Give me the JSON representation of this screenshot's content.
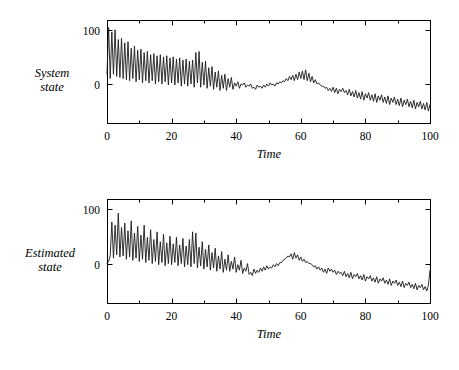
{
  "figure": {
    "background": "#ffffff",
    "line_color": "#1a1a1a",
    "axis_color": "#000000"
  },
  "chart_data": [
    {
      "type": "line",
      "title": "",
      "subtitle": "",
      "xlabel": "Time",
      "ylabel": "System state",
      "ylabel_lines": [
        "System",
        "state"
      ],
      "xlim": [
        0,
        100
      ],
      "ylim": [
        -72,
        118
      ],
      "xticks": [
        0,
        20,
        40,
        60,
        80,
        100
      ],
      "xtick_labels": [
        "0",
        "20",
        "40",
        "60",
        "80",
        "100"
      ],
      "xminor_step": 10,
      "yticks": [
        0,
        100
      ],
      "ytick_labels": [
        "0",
        "100"
      ],
      "grid": false,
      "legend": null,
      "series": [
        {
          "name": "System state",
          "x": [
            0,
            0.5,
            1,
            1.5,
            2,
            2.5,
            3,
            3.5,
            4,
            4.5,
            5,
            5.5,
            6,
            6.5,
            7,
            7.5,
            8,
            8.5,
            9,
            9.5,
            10,
            10.5,
            11,
            11.5,
            12,
            12.5,
            13,
            13.5,
            14,
            14.5,
            15,
            15.5,
            16,
            16.5,
            17,
            17.5,
            18,
            18.5,
            19,
            19.5,
            20,
            20.5,
            21,
            21.5,
            22,
            22.5,
            23,
            23.5,
            24,
            24.5,
            25,
            25.5,
            26,
            26.5,
            27,
            27.5,
            28,
            28.5,
            29,
            29.5,
            30,
            30.5,
            31,
            31.5,
            32,
            32.5,
            33,
            33.5,
            34,
            34.5,
            35,
            35.5,
            36,
            36.5,
            37,
            37.5,
            38,
            38.5,
            39,
            39.5,
            40,
            40.5,
            41,
            41.5,
            42,
            42.5,
            43,
            43.5,
            44,
            44.5,
            45,
            45.5,
            46,
            46.5,
            47,
            47.5,
            48,
            48.5,
            49,
            49.5,
            50,
            50.5,
            51,
            51.5,
            52,
            52.5,
            53,
            53.5,
            54,
            54.5,
            55,
            55.5,
            56,
            56.5,
            57,
            57.5,
            58,
            58.5,
            59,
            59.5,
            60,
            60.5,
            61,
            61.5,
            62,
            62.5,
            63,
            63.5,
            64,
            64.5,
            65,
            65.5,
            66,
            66.5,
            67,
            67.5,
            68,
            68.5,
            69,
            69.5,
            70,
            70.5,
            71,
            71.5,
            72,
            72.5,
            73,
            73.5,
            74,
            74.5,
            75,
            75.5,
            76,
            76.5,
            77,
            77.5,
            78,
            78.5,
            79,
            79.5,
            80,
            80.5,
            81,
            81.5,
            82,
            82.5,
            83,
            83.5,
            84,
            84.5,
            85,
            85.5,
            86,
            86.5,
            87,
            87.5,
            88,
            88.5,
            89,
            89.5,
            90,
            90.5,
            91,
            91.5,
            92,
            92.5,
            93,
            93.5,
            94,
            94.5,
            95,
            95.5,
            96,
            96.5,
            97,
            97.5,
            98,
            98.5,
            99,
            99.5,
            100
          ],
          "y": [
            18,
            104,
            10,
            96,
            18,
            100,
            14,
            82,
            12,
            84,
            10,
            76,
            8,
            78,
            6,
            66,
            10,
            70,
            4,
            62,
            8,
            64,
            2,
            58,
            6,
            60,
            2,
            54,
            6,
            56,
            0,
            52,
            4,
            54,
            0,
            50,
            4,
            52,
            -2,
            48,
            2,
            50,
            -2,
            46,
            2,
            48,
            -4,
            44,
            0,
            46,
            -4,
            42,
            0,
            44,
            -6,
            58,
            2,
            60,
            -6,
            40,
            -2,
            42,
            -8,
            30,
            -4,
            32,
            -10,
            22,
            -6,
            24,
            -12,
            16,
            -8,
            18,
            -12,
            10,
            -6,
            12,
            -10,
            2,
            -4,
            4,
            -8,
            0,
            -2,
            2,
            -6,
            -2,
            -4,
            0,
            -8,
            -6,
            -10,
            -2,
            -6,
            -4,
            -8,
            -2,
            -6,
            0,
            -4,
            2,
            -2,
            0,
            -4,
            2,
            0,
            4,
            2,
            6,
            4,
            10,
            6,
            14,
            8,
            16,
            6,
            18,
            8,
            22,
            10,
            24,
            8,
            26,
            6,
            20,
            4,
            14,
            2,
            8,
            0,
            2,
            -2,
            -4,
            -4,
            -8,
            -6,
            -12,
            -8,
            -14,
            -6,
            -16,
            -8,
            -18,
            -10,
            -14,
            -8,
            -16,
            -12,
            -20,
            -10,
            -22,
            -14,
            -24,
            -12,
            -26,
            -16,
            -28,
            -14,
            -30,
            -18,
            -26,
            -16,
            -30,
            -20,
            -32,
            -18,
            -34,
            -22,
            -30,
            -20,
            -34,
            -24,
            -36,
            -22,
            -38,
            -26,
            -34,
            -24,
            -38,
            -28,
            -40,
            -26,
            -42,
            -30,
            -38,
            -28,
            -42,
            -32,
            -44,
            -30,
            -46,
            -34,
            -42,
            -32,
            -46,
            -36,
            -48,
            -34,
            -50,
            -38,
            -46,
            -36,
            -50,
            -40,
            -52,
            -38,
            -54,
            -42,
            -50,
            -40,
            -54,
            -44,
            -10,
            -48,
            -56
          ]
        }
      ]
    },
    {
      "type": "line",
      "title": "",
      "subtitle": "",
      "xlabel": "Time",
      "ylabel": "Estimated state",
      "ylabel_lines": [
        "Estimated",
        "state"
      ],
      "xlim": [
        0,
        100
      ],
      "ylim": [
        -72,
        118
      ],
      "xticks": [
        0,
        20,
        40,
        60,
        80,
        100
      ],
      "xtick_labels": [
        "0",
        "20",
        "40",
        "60",
        "80",
        "100"
      ],
      "xminor_step": 10,
      "yticks": [
        0,
        100
      ],
      "ytick_labels": [
        "0",
        "100"
      ],
      "grid": false,
      "legend": null,
      "series": [
        {
          "name": "Estimated state",
          "x": [
            0,
            0.5,
            1,
            1.5,
            2,
            2.5,
            3,
            3.5,
            4,
            4.5,
            5,
            5.5,
            6,
            6.5,
            7,
            7.5,
            8,
            8.5,
            9,
            9.5,
            10,
            10.5,
            11,
            11.5,
            12,
            12.5,
            13,
            13.5,
            14,
            14.5,
            15,
            15.5,
            16,
            16.5,
            17,
            17.5,
            18,
            18.5,
            19,
            19.5,
            20,
            20.5,
            21,
            21.5,
            22,
            22.5,
            23,
            23.5,
            24,
            24.5,
            25,
            25.5,
            26,
            26.5,
            27,
            27.5,
            28,
            28.5,
            29,
            29.5,
            30,
            30.5,
            31,
            31.5,
            32,
            32.5,
            33,
            33.5,
            34,
            34.5,
            35,
            35.5,
            36,
            36.5,
            37,
            37.5,
            38,
            38.5,
            39,
            39.5,
            40,
            40.5,
            41,
            41.5,
            42,
            42.5,
            43,
            43.5,
            44,
            44.5,
            45,
            45.5,
            46,
            46.5,
            47,
            47.5,
            48,
            48.5,
            49,
            49.5,
            50,
            50.5,
            51,
            51.5,
            52,
            52.5,
            53,
            53.5,
            54,
            54.5,
            55,
            55.5,
            56,
            56.5,
            57,
            57.5,
            58,
            58.5,
            59,
            59.5,
            60,
            60.5,
            61,
            61.5,
            62,
            62.5,
            63,
            63.5,
            64,
            64.5,
            65,
            65.5,
            66,
            66.5,
            67,
            67.5,
            68,
            68.5,
            69,
            69.5,
            70,
            70.5,
            71,
            71.5,
            72,
            72.5,
            73,
            73.5,
            74,
            74.5,
            75,
            75.5,
            76,
            76.5,
            77,
            77.5,
            78,
            78.5,
            79,
            79.5,
            80,
            80.5,
            81,
            81.5,
            82,
            82.5,
            83,
            83.5,
            84,
            84.5,
            85,
            85.5,
            86,
            86.5,
            87,
            87.5,
            88,
            88.5,
            89,
            89.5,
            90,
            90.5,
            91,
            91.5,
            92,
            92.5,
            93,
            93.5,
            94,
            94.5,
            95,
            95.5,
            96,
            96.5,
            97,
            97.5,
            98,
            98.5,
            99,
            99.5,
            100
          ],
          "y": [
            0,
            4,
            14,
            76,
            10,
            70,
            16,
            92,
            12,
            66,
            14,
            74,
            8,
            60,
            12,
            78,
            6,
            56,
            10,
            68,
            4,
            52,
            8,
            70,
            2,
            48,
            6,
            62,
            0,
            44,
            4,
            58,
            -2,
            40,
            2,
            54,
            -4,
            38,
            0,
            50,
            -2,
            36,
            2,
            48,
            -4,
            34,
            0,
            46,
            -6,
            32,
            -2,
            44,
            -6,
            58,
            0,
            56,
            -8,
            30,
            -4,
            40,
            -10,
            26,
            -6,
            34,
            -12,
            20,
            -8,
            28,
            -14,
            14,
            -10,
            22,
            -16,
            8,
            -12,
            16,
            -14,
            4,
            -10,
            12,
            -16,
            -2,
            -12,
            6,
            -18,
            -8,
            -14,
            0,
            -20,
            -16,
            -22,
            -10,
            -18,
            -12,
            -16,
            -8,
            -14,
            -6,
            -12,
            -4,
            -10,
            -6,
            -8,
            -2,
            -6,
            0,
            -4,
            2,
            2,
            6,
            8,
            10,
            14,
            12,
            18,
            8,
            20,
            10,
            16,
            6,
            12,
            4,
            8,
            2,
            4,
            0,
            0,
            -2,
            -6,
            -4,
            -10,
            -6,
            -12,
            -8,
            -16,
            -10,
            -18,
            -8,
            -14,
            -10,
            -16,
            -12,
            -20,
            -14,
            -18,
            -16,
            -22,
            -14,
            -24,
            -18,
            -26,
            -16,
            -28,
            -20,
            -24,
            -18,
            -28,
            -22,
            -30,
            -20,
            -32,
            -24,
            -28,
            -22,
            -32,
            -26,
            -34,
            -24,
            -36,
            -28,
            -32,
            -26,
            -36,
            -30,
            -38,
            -28,
            -40,
            -32,
            -36,
            -30,
            -40,
            -34,
            -42,
            -32,
            -44,
            -36,
            -40,
            -34,
            -44,
            -38,
            -46,
            -36,
            -48,
            -40,
            -44,
            -38,
            -48,
            -42,
            -50,
            -40,
            -12,
            -44,
            -54
          ]
        }
      ]
    }
  ]
}
